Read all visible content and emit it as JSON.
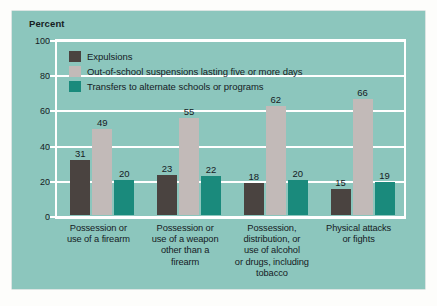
{
  "chart_data": {
    "type": "bar",
    "title": "",
    "xlabel": "",
    "ylabel": "Percent",
    "ylim": [
      0,
      100
    ],
    "yticks": [
      0,
      20,
      40,
      60,
      80,
      100
    ],
    "grid": true,
    "legend_position": "top-left inside plot area",
    "categories": [
      "Possession or\nuse of a firearm",
      "Possession or\nuse of a weapon\nother than a\nfirearm",
      "Possession,\ndistribution, or\nuse of alcohol\nor drugs, including\ntobacco",
      "Physical attacks\nor fights"
    ],
    "series": [
      {
        "name": "Expulsions",
        "color": "#4a4340",
        "values": [
          31,
          23,
          18,
          15
        ]
      },
      {
        "name": "Out-of-school suspensions lasting five or more days",
        "color": "#c2bab8",
        "values": [
          49,
          55,
          62,
          66
        ]
      },
      {
        "name": "Transfers to alternate schools or programs",
        "color": "#1a8a7c",
        "values": [
          20,
          22,
          20,
          19
        ]
      }
    ]
  },
  "axis": {
    "y_title": "Percent",
    "tick_labels": [
      "100",
      "80",
      "60",
      "40",
      "20",
      "0"
    ]
  },
  "legend": {
    "items": [
      {
        "label": "Expulsions",
        "color": "#4a4340"
      },
      {
        "label": "Out-of-school suspensions lasting five or more days",
        "color": "#c2bab8"
      },
      {
        "label": "Transfers to alternate schools or programs",
        "color": "#1a8a7c"
      }
    ]
  },
  "category_labels": [
    [
      "Possession or",
      "use of a firearm"
    ],
    [
      "Possession or",
      "use of a weapon",
      "other than a",
      "firearm"
    ],
    [
      "Possession,",
      "distribution, or",
      "use of alcohol",
      "or drugs, including",
      "tobacco"
    ],
    [
      "Physical attacks",
      "or fights"
    ]
  ],
  "colors": {
    "panel_background": "#8cc6bd",
    "page_background": "#fdfdfb",
    "gridline": "#ffffff",
    "text": "#15201f"
  }
}
